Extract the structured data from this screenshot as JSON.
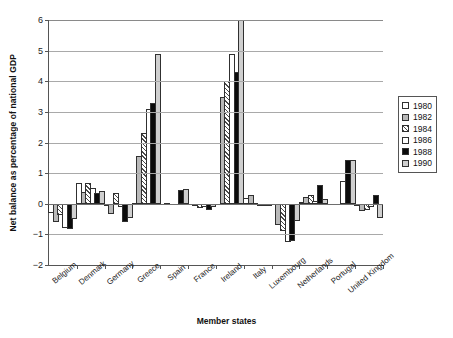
{
  "faint_header": "",
  "chart_data": {
    "type": "bar",
    "title": "",
    "xlabel": "Member states",
    "ylabel": "Net balance as percentage of national GDP",
    "ylim": [
      -2,
      6
    ],
    "yticks": [
      6,
      5,
      4,
      3,
      2,
      1,
      0,
      -1,
      -2
    ],
    "ytick_labels": [
      "6",
      "5",
      "4",
      "3",
      "2",
      "1",
      "0",
      "−1",
      "−2"
    ],
    "grid": true,
    "legend_position": "right",
    "categories": [
      "Belgium",
      "Denmark",
      "Germany",
      "Greece",
      "Spain",
      "France",
      "Ireland",
      "Italy",
      "Luxembourg",
      "Netherlands",
      "Portugal",
      "United Kingdom"
    ],
    "series": [
      {
        "name": "1980",
        "pattern": "white-open",
        "values": [
          -0.3,
          0.68,
          -0.02,
          0.02,
          null,
          null,
          null,
          0.18,
          null,
          0.05,
          null,
          -0.02
        ]
      },
      {
        "name": "1982",
        "pattern": "solid-grey",
        "values": [
          -0.58,
          0.4,
          -0.35,
          1.55,
          0.03,
          -0.05,
          3.5,
          0.27,
          -0.7,
          0.22,
          null,
          -0.25
        ]
      },
      {
        "name": "1984",
        "pattern": "hatched",
        "values": [
          -0.38,
          0.68,
          0.35,
          2.3,
          null,
          -0.13,
          4.0,
          0.02,
          -0.9,
          0.28,
          null,
          -0.22
        ]
      },
      {
        "name": "1986",
        "pattern": "white-open",
        "values": [
          -0.8,
          0.5,
          -0.1,
          3.1,
          null,
          -0.1,
          4.9,
          -0.03,
          -1.25,
          0.1,
          0.75,
          -0.1
        ]
      },
      {
        "name": "1988",
        "pattern": "solid-black",
        "values": [
          -0.82,
          0.36,
          -0.6,
          3.3,
          0.45,
          -0.2,
          4.3,
          -0.05,
          -1.2,
          0.6,
          1.42,
          0.28
        ]
      },
      {
        "name": "1990",
        "pattern": "light-grey",
        "values": [
          -0.5,
          0.42,
          -0.48,
          4.9,
          0.48,
          -0.12,
          6.6,
          -0.06,
          -0.55,
          0.17,
          1.42,
          -0.45
        ]
      }
    ],
    "notes": {
      "clipped_series": "1990",
      "clipped_category": "Ireland",
      "clipped_reason": "value exceeds axis maximum of 6"
    }
  },
  "legend": {
    "entries": [
      {
        "label": "1980",
        "pattern": "white-open"
      },
      {
        "label": "1982",
        "pattern": "solid-grey"
      },
      {
        "label": "1984",
        "pattern": "hatched"
      },
      {
        "label": "1986",
        "pattern": "white-open"
      },
      {
        "label": "1988",
        "pattern": "solid-black"
      },
      {
        "label": "1990",
        "pattern": "light-grey"
      }
    ]
  }
}
